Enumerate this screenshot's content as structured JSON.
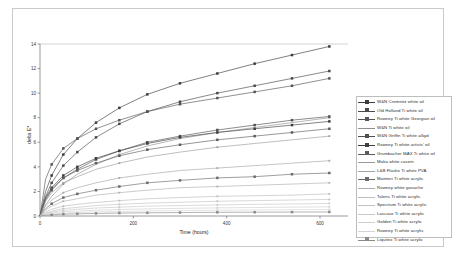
{
  "chart_data": {
    "type": "line",
    "title": "",
    "xlabel": "Time (hours)",
    "ylabel": "delta E*",
    "xlim": [
      0,
      660
    ],
    "ylim": [
      0,
      14
    ],
    "xticks": [
      0,
      200,
      400,
      600
    ],
    "yticks": [
      0,
      2,
      4,
      6,
      8,
      10,
      12,
      14
    ],
    "grid": false,
    "legend_position": "right",
    "x": [
      0,
      12,
      25,
      50,
      80,
      120,
      170,
      230,
      300,
      380,
      460,
      540,
      620
    ],
    "series": [
      {
        "name": "W&N Cremnitz white oil",
        "marker": "square",
        "color": "#3c3c3c",
        "values": [
          0,
          2.0,
          3.3,
          5.0,
          6.3,
          7.6,
          8.8,
          9.9,
          10.8,
          11.6,
          12.4,
          13.1,
          13.8
        ]
      },
      {
        "name": "Old Holland Ti white oil",
        "marker": "square",
        "color": "#4a4a4a",
        "values": [
          0,
          1.6,
          2.7,
          4.1,
          5.2,
          6.4,
          7.5,
          8.5,
          9.3,
          10.0,
          10.6,
          11.2,
          11.8
        ]
      },
      {
        "name": "Rowney Ti white Georgian oil",
        "marker": "square",
        "color": "#555555",
        "values": [
          0,
          3.0,
          4.2,
          5.5,
          6.3,
          7.1,
          7.8,
          8.5,
          9.1,
          9.6,
          10.1,
          10.6,
          11.2
        ]
      },
      {
        "name": "W&N Ti white oil",
        "marker": "none",
        "color": "#8f8f8f",
        "values": [
          0,
          0.9,
          1.6,
          2.6,
          3.4,
          4.2,
          5.0,
          5.7,
          6.3,
          6.8,
          7.2,
          7.6,
          8.0
        ]
      },
      {
        "name": "W&N Griffin Ti white alkyd",
        "marker": "square",
        "color": "#4f4f4f",
        "values": [
          0,
          1.3,
          2.1,
          3.1,
          3.8,
          4.6,
          5.3,
          6.0,
          6.5,
          7.0,
          7.4,
          7.8,
          8.1
        ]
      },
      {
        "name": "Rowney Ti white artists' oil",
        "marker": "square",
        "color": "#3f3f3f",
        "values": [
          0,
          1.5,
          2.3,
          3.3,
          4.0,
          4.7,
          5.3,
          5.9,
          6.4,
          6.8,
          7.1,
          7.4,
          7.7
        ]
      },
      {
        "name": "Grumbacher MAX Ti white oil",
        "marker": "square",
        "color": "#5c5c5c",
        "values": [
          0,
          1.4,
          2.2,
          3.1,
          3.7,
          4.3,
          4.9,
          5.4,
          5.8,
          6.2,
          6.5,
          6.8,
          7.1
        ]
      },
      {
        "name": "Maka white casein",
        "marker": "none",
        "color": "#9a9a9a",
        "values": [
          0,
          1.2,
          1.9,
          2.7,
          3.2,
          3.8,
          4.3,
          4.8,
          5.2,
          5.6,
          5.9,
          6.2,
          6.5
        ]
      },
      {
        "name": "L&B Flashe Ti white PVA",
        "marker": "none",
        "color": "#a5a5a5",
        "values": [
          0,
          0.8,
          1.3,
          1.9,
          2.3,
          2.7,
          3.1,
          3.4,
          3.7,
          3.9,
          4.1,
          4.3,
          4.5
        ]
      },
      {
        "name": "Maimeri Ti white acrylic",
        "marker": "square",
        "color": "#6b6b6b",
        "values": [
          0,
          0.6,
          1.0,
          1.5,
          1.8,
          2.1,
          2.4,
          2.7,
          2.9,
          3.1,
          3.2,
          3.4,
          3.5
        ]
      },
      {
        "name": "Rowney white gouache",
        "marker": "none",
        "color": "#b0b0b0",
        "values": [
          0,
          0.5,
          0.8,
          1.2,
          1.4,
          1.7,
          1.9,
          2.1,
          2.3,
          2.4,
          2.5,
          2.6,
          2.7
        ]
      },
      {
        "name": "Talens Ti white acrylic",
        "marker": "none",
        "color": "#bdbdbd",
        "values": [
          0,
          0.35,
          0.55,
          0.8,
          0.95,
          1.1,
          1.25,
          1.4,
          1.5,
          1.6,
          1.65,
          1.7,
          1.8
        ]
      },
      {
        "name": "Spectrum Ti white acrylic",
        "marker": "none",
        "color": "#c2c2c2",
        "values": [
          0,
          0.25,
          0.4,
          0.6,
          0.7,
          0.85,
          0.95,
          1.05,
          1.12,
          1.2,
          1.25,
          1.3,
          1.35
        ]
      },
      {
        "name": "Lascaux Ti white acrylic",
        "marker": "none",
        "color": "#c8c8c8",
        "values": [
          0,
          0.2,
          0.32,
          0.45,
          0.55,
          0.65,
          0.72,
          0.8,
          0.85,
          0.9,
          0.95,
          0.98,
          1.02
        ]
      },
      {
        "name": "Golden Ti white acrylic",
        "marker": "none",
        "color": "#cfcfcf",
        "values": [
          0,
          0.15,
          0.24,
          0.34,
          0.4,
          0.47,
          0.53,
          0.58,
          0.62,
          0.66,
          0.69,
          0.72,
          0.75
        ]
      },
      {
        "name": "Rowney Ti white acrylic",
        "marker": "none",
        "color": "#d4d4d4",
        "values": [
          0,
          0.1,
          0.16,
          0.23,
          0.28,
          0.33,
          0.37,
          0.41,
          0.44,
          0.47,
          0.49,
          0.51,
          0.53
        ]
      },
      {
        "name": "Liquitex Ti white acrylic",
        "marker": "square",
        "color": "#8a8a8a",
        "values": [
          0,
          0.06,
          0.1,
          0.15,
          0.18,
          0.21,
          0.24,
          0.26,
          0.28,
          0.3,
          0.31,
          0.32,
          0.33
        ]
      }
    ]
  },
  "legend": {
    "items": [
      {
        "label": "W&N Cremnitz white oil"
      },
      {
        "label": "Old Holland Ti white oil"
      },
      {
        "label": "Rowney Ti white Georgian oil"
      },
      {
        "label": "W&N Ti white oil"
      },
      {
        "label": "W&N Griffin Ti white alkyd"
      },
      {
        "label": "Rowney Ti white artists' oil"
      },
      {
        "label": "Grumbacher MAX Ti white oil"
      },
      {
        "label": "Maka white casein"
      },
      {
        "label": "L&B Flashe Ti white PVA"
      },
      {
        "label": "Maimeri Ti white acrylic"
      },
      {
        "label": "Rowney white gouache"
      },
      {
        "label": "Talens Ti white acrylic"
      },
      {
        "label": "Spectrum Ti white acrylic"
      },
      {
        "label": "Lascaux Ti white acrylic"
      },
      {
        "label": "Golden Ti white acrylic"
      },
      {
        "label": "Rowney Ti white acrylic"
      },
      {
        "label": "Liquitex Ti white acrylic"
      }
    ]
  },
  "axes": {
    "x_title": "Time (hours)",
    "y_title": "delta E*"
  },
  "colors": {
    "frame": "#c9c9c9",
    "axis": "#7a7a7a",
    "background": "#ffffff"
  }
}
